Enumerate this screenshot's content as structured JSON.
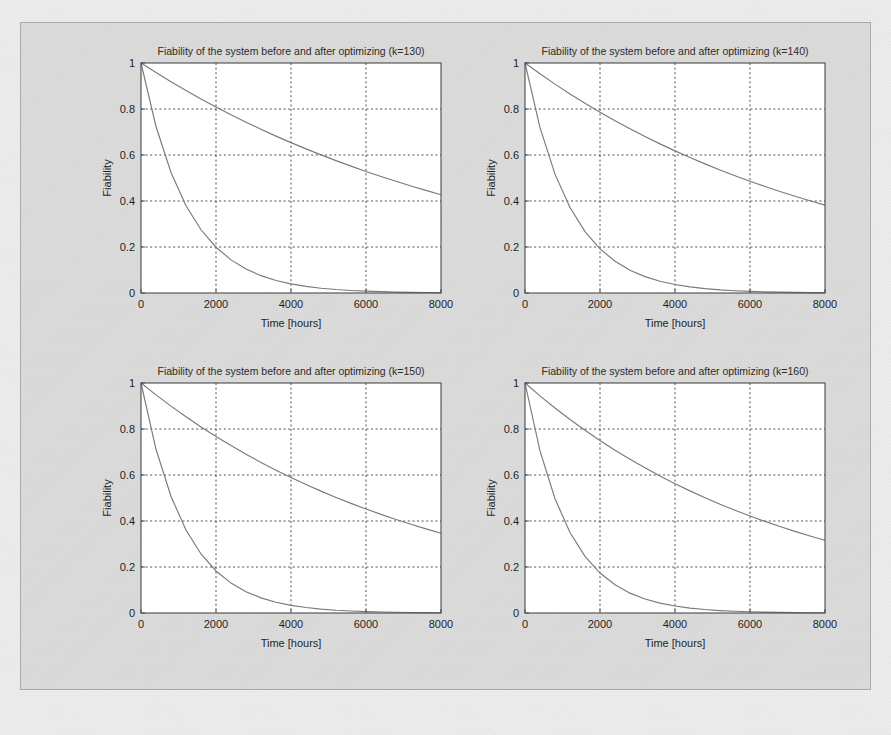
{
  "figure": {
    "background_color": "#e3e3e3",
    "page_color": "#f2f2f2",
    "curve_color": "#7a7a7a",
    "axis_color": "#4a4a4a",
    "grid_color": "#3a3a3a",
    "layout": "2x2 subplot grid"
  },
  "chart_data": [
    {
      "type": "line",
      "title": "Fiability of the system before and after optimizing (k=130)",
      "xlabel": "Time [hours]",
      "ylabel": "Fiability",
      "xlim": [
        0,
        8000
      ],
      "ylim": [
        0,
        1
      ],
      "xticks": [
        0,
        2000,
        4000,
        6000,
        8000
      ],
      "xtick_labels": [
        "0",
        "2000",
        "4000",
        "6000",
        "8000"
      ],
      "yticks": [
        0,
        0.2,
        0.4,
        0.6,
        0.8,
        1
      ],
      "ytick_labels": [
        "0",
        "0.2",
        "0.4",
        "0.6",
        "0.8",
        "1"
      ],
      "grid": true,
      "legend": null,
      "k": 130,
      "series": [
        {
          "name": "before optimizing",
          "x": [
            0,
            400,
            800,
            1200,
            1600,
            2000,
            2400,
            2800,
            3200,
            3600,
            4000,
            4400,
            4800,
            5200,
            5600,
            6000,
            6400,
            6800,
            7200,
            7600,
            8000
          ],
          "values": [
            1.0,
            0.724,
            0.524,
            0.379,
            0.275,
            0.199,
            0.144,
            0.104,
            0.0754,
            0.0546,
            0.0396,
            0.0287,
            0.0208,
            0.015,
            0.0109,
            0.0079,
            0.0057,
            0.0041,
            0.003,
            0.0022,
            0.0016
          ]
        },
        {
          "name": "after optimizing",
          "x": [
            0,
            400,
            800,
            1200,
            1600,
            2000,
            2400,
            2800,
            3200,
            3600,
            4000,
            4400,
            4800,
            5200,
            5600,
            6000,
            6400,
            6800,
            7200,
            7600,
            8000
          ],
          "values": [
            1.0,
            0.9585,
            0.9186,
            0.8804,
            0.8437,
            0.8086,
            0.7749,
            0.7427,
            0.7118,
            0.6821,
            0.6538,
            0.6266,
            0.6005,
            0.5755,
            0.5516,
            0.5286,
            0.5066,
            0.4856,
            0.4654,
            0.446,
            0.4275
          ]
        }
      ]
    },
    {
      "type": "line",
      "title": "Fiability of the system before and after optimizing (k=140)",
      "xlabel": "Time [hours]",
      "ylabel": "Fiability",
      "xlim": [
        0,
        8000
      ],
      "ylim": [
        0,
        1
      ],
      "xticks": [
        0,
        2000,
        4000,
        6000,
        8000
      ],
      "xtick_labels": [
        "0",
        "2000",
        "4000",
        "6000",
        "8000"
      ],
      "yticks": [
        0,
        0.2,
        0.4,
        0.6,
        0.8,
        1
      ],
      "ytick_labels": [
        "0",
        "0.2",
        "0.4",
        "0.6",
        "0.8",
        "1"
      ],
      "grid": true,
      "legend": null,
      "k": 140,
      "series": [
        {
          "name": "before optimizing",
          "x": [
            0,
            400,
            800,
            1200,
            1600,
            2000,
            2400,
            2800,
            3200,
            3600,
            4000,
            4400,
            4800,
            5200,
            5600,
            6000,
            6400,
            6800,
            7200,
            7600,
            8000
          ],
          "values": [
            1.0,
            0.7189,
            0.5168,
            0.3715,
            0.2671,
            0.192,
            0.138,
            0.0992,
            0.0713,
            0.0513,
            0.0369,
            0.0265,
            0.0191,
            0.0137,
            0.0098,
            0.0071,
            0.0051,
            0.0037,
            0.0026,
            0.0019,
            0.0014
          ]
        },
        {
          "name": "after optimizing",
          "x": [
            0,
            400,
            800,
            1200,
            1600,
            2000,
            2400,
            2800,
            3200,
            3600,
            4000,
            4400,
            4800,
            5200,
            5600,
            6000,
            6400,
            6800,
            7200,
            7600,
            8000
          ],
          "values": [
            1.0,
            0.953,
            0.9082,
            0.8655,
            0.8248,
            0.786,
            0.7491,
            0.7139,
            0.6804,
            0.6484,
            0.618,
            0.589,
            0.5613,
            0.535,
            0.5098,
            0.4859,
            0.4631,
            0.4413,
            0.4206,
            0.4009,
            0.382
          ]
        }
      ]
    },
    {
      "type": "line",
      "title": "Fiability of the system before and after optimizing (k=150)",
      "xlabel": "Time [hours]",
      "ylabel": "Fiability",
      "xlim": [
        0,
        8000
      ],
      "ylim": [
        0,
        1
      ],
      "xticks": [
        0,
        2000,
        4000,
        6000,
        8000
      ],
      "xtick_labels": [
        "0",
        "2000",
        "4000",
        "6000",
        "8000"
      ],
      "yticks": [
        0,
        0.2,
        0.4,
        0.6,
        0.8,
        1
      ],
      "ytick_labels": [
        "0",
        "0.2",
        "0.4",
        "0.6",
        "0.8",
        "1"
      ],
      "grid": true,
      "legend": null,
      "k": 150,
      "series": [
        {
          "name": "before optimizing",
          "x": [
            0,
            400,
            800,
            1200,
            1600,
            2000,
            2400,
            2800,
            3200,
            3600,
            4000,
            4400,
            4800,
            5200,
            5600,
            6000,
            6400,
            6800,
            7200,
            7600,
            8000
          ],
          "values": [
            1.0,
            0.7118,
            0.5067,
            0.3607,
            0.2567,
            0.1827,
            0.1301,
            0.0926,
            0.0659,
            0.0469,
            0.0334,
            0.0238,
            0.0169,
            0.012,
            0.0086,
            0.0061,
            0.0043,
            0.0031,
            0.0022,
            0.0016,
            0.0011
          ]
        },
        {
          "name": "after optimizing",
          "x": [
            0,
            400,
            800,
            1200,
            1600,
            2000,
            2400,
            2800,
            3200,
            3600,
            4000,
            4400,
            4800,
            5200,
            5600,
            6000,
            6400,
            6800,
            7200,
            7600,
            8000
          ],
          "values": [
            1.0,
            0.9484,
            0.8995,
            0.8531,
            0.8091,
            0.7674,
            0.7278,
            0.6903,
            0.6547,
            0.6209,
            0.5889,
            0.5586,
            0.5298,
            0.5025,
            0.4766,
            0.452,
            0.4287,
            0.4066,
            0.3856,
            0.3657,
            0.3468
          ]
        }
      ]
    },
    {
      "type": "line",
      "title": "Fiability of the system before and after optimizing (k=160)",
      "xlabel": "Time [hours]",
      "ylabel": "Fiability",
      "xlim": [
        0,
        8000
      ],
      "ylim": [
        0,
        1
      ],
      "xticks": [
        0,
        2000,
        4000,
        6000,
        8000
      ],
      "xtick_labels": [
        "0",
        "2000",
        "4000",
        "6000",
        "8000"
      ],
      "yticks": [
        0,
        0.2,
        0.4,
        0.6,
        0.8,
        1
      ],
      "ytick_labels": [
        "0",
        "0.2",
        "0.4",
        "0.6",
        "0.8",
        "1"
      ],
      "grid": true,
      "legend": null,
      "k": 160,
      "series": [
        {
          "name": "before optimizing",
          "x": [
            0,
            400,
            800,
            1200,
            1600,
            2000,
            2400,
            2800,
            3200,
            3600,
            4000,
            4400,
            4800,
            5200,
            5600,
            6000,
            6400,
            6800,
            7200,
            7600,
            8000
          ],
          "values": [
            1.0,
            0.7047,
            0.4966,
            0.35,
            0.2466,
            0.1738,
            0.1225,
            0.0863,
            0.0608,
            0.0429,
            0.0302,
            0.0213,
            0.015,
            0.0106,
            0.0075,
            0.0052,
            0.0037,
            0.0026,
            0.0018,
            0.0013,
            0.0009
          ]
        },
        {
          "name": "after optimizing",
          "x": [
            0,
            400,
            800,
            1200,
            1600,
            2000,
            2400,
            2800,
            3200,
            3600,
            4000,
            4400,
            4800,
            5200,
            5600,
            6000,
            6400,
            6800,
            7200,
            7600,
            8000
          ],
          "values": [
            1.0,
            0.9441,
            0.8913,
            0.8415,
            0.7944,
            0.75,
            0.708,
            0.6684,
            0.631,
            0.5957,
            0.5624,
            0.5309,
            0.5013,
            0.4732,
            0.4468,
            0.4218,
            0.3982,
            0.3759,
            0.3549,
            0.335,
            0.3163
          ]
        }
      ]
    }
  ]
}
